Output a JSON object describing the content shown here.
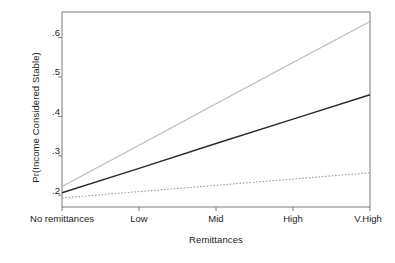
{
  "chart_data": {
    "type": "line",
    "title": "",
    "xlabel": "Remittances",
    "ylabel": "Pr(Income Considered Stable)",
    "categories": [
      "No remittances",
      "Low",
      "Mid",
      "High",
      "V.High"
    ],
    "x": [
      0,
      1,
      2,
      3,
      4
    ],
    "xlim": [
      0,
      4
    ],
    "ylim": [
      0.17,
      0.665
    ],
    "yticks": [
      0.2,
      0.3,
      0.4,
      0.5,
      0.6
    ],
    "ytick_labels": [
      ".2",
      ".3",
      ".4",
      ".5",
      ".6"
    ],
    "grid": false,
    "legend": "none",
    "series": [
      {
        "name": "Upper 95% CI",
        "style": "thin-gray",
        "color": "#b9b9b9",
        "values": [
          0.222,
          0.327,
          0.432,
          0.537,
          0.641
        ]
      },
      {
        "name": "Predicted probability",
        "style": "solid-dark",
        "color": "#2b2b2b",
        "values": [
          0.206,
          0.268,
          0.331,
          0.393,
          0.455
        ]
      },
      {
        "name": "Lower 95% CI",
        "style": "dotted-gray",
        "color": "#9a9a9a",
        "values": [
          0.193,
          0.209,
          0.225,
          0.241,
          0.257
        ]
      }
    ],
    "axis_color": "#707070",
    "text_color": "#1c1c1c",
    "background": "#ffffff"
  },
  "axes": {
    "ytick_labels": [
      ".6",
      ".5",
      ".4",
      ".3",
      ".2"
    ],
    "xtick_labels": [
      "No remittances",
      "Low",
      "Mid",
      "High",
      "V.High"
    ],
    "x_title": "Remittances",
    "y_title": "Pr(Income Considered Stable)"
  }
}
